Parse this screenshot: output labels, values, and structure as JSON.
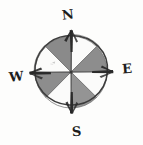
{
  "figure": {
    "name": "compass-rose",
    "style": "hand-drawn pencil sketch",
    "background_color": "#fdfdfc"
  },
  "labels": {
    "north": "N",
    "east": "E",
    "west": "W",
    "south": "S"
  },
  "colors": {
    "ink": "#1d1d1d",
    "outline": "#3a3a3a",
    "sector_dark": "#8d8d8d",
    "sector_dark_alt": "#9a9a9a",
    "sector_light": "#fbfbfa",
    "needle": "#2a2a2a",
    "smudge": "#b9b9b9"
  },
  "geometry": {
    "center_x": 71,
    "center_y": 72,
    "radius": 36,
    "sector_count": 8,
    "needle_length": 54
  },
  "sectors": [
    {
      "name": "n-ne",
      "from_deg": 0,
      "to_deg": 45,
      "fill": "light"
    },
    {
      "name": "ne-e",
      "from_deg": 45,
      "to_deg": 90,
      "fill": "dark"
    },
    {
      "name": "e-se",
      "from_deg": 90,
      "to_deg": 135,
      "fill": "light"
    },
    {
      "name": "se-s",
      "from_deg": 135,
      "to_deg": 180,
      "fill": "dark"
    },
    {
      "name": "s-sw",
      "from_deg": 180,
      "to_deg": 225,
      "fill": "light"
    },
    {
      "name": "sw-w",
      "from_deg": 225,
      "to_deg": 270,
      "fill": "dark"
    },
    {
      "name": "w-nw",
      "from_deg": 270,
      "to_deg": 315,
      "fill": "light"
    },
    {
      "name": "nw-n",
      "from_deg": 315,
      "to_deg": 360,
      "fill": "dark"
    }
  ],
  "needles": [
    {
      "name": "needle-north",
      "direction": "N"
    },
    {
      "name": "needle-east",
      "direction": "E"
    },
    {
      "name": "needle-south",
      "direction": "S"
    },
    {
      "name": "needle-west",
      "direction": "W"
    }
  ]
}
